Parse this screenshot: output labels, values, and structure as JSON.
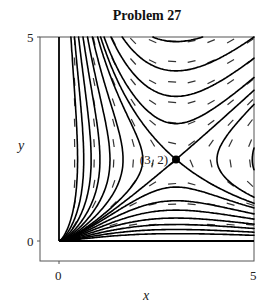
{
  "chart_data": {
    "type": "line",
    "subtype": "phase-portrait",
    "title": "Problem 27",
    "xlabel": "x",
    "ylabel": "y",
    "xlim": [
      0,
      5
    ],
    "ylim": [
      0,
      5
    ],
    "x_ticks": [
      "0",
      "5"
    ],
    "y_ticks": [
      "0",
      "5"
    ],
    "grid": false,
    "system": {
      "dx": "x*(y-2)",
      "dy": "y*(x-3)"
    },
    "equilibrium": {
      "x": 3,
      "y": 2,
      "label": "(3, 2)",
      "type": "saddle"
    },
    "trajectory_levels": [
      -0.15,
      -0.45,
      -0.8,
      -1.2,
      -1.7,
      -2.3,
      -3.0,
      0.15,
      0.4,
      0.7,
      1.1,
      1.6,
      2.2,
      3.0
    ],
    "separatrix_level": 0,
    "axis_trajectories": [
      "x-axis",
      "y-axis"
    ],
    "direction_field": true
  }
}
